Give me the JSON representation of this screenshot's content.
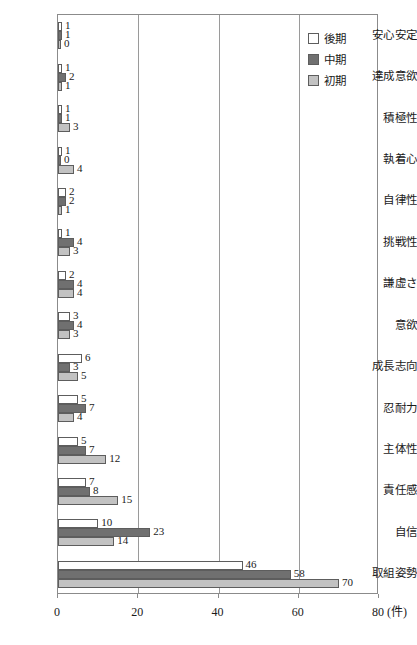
{
  "chart_data": {
    "type": "bar",
    "orientation": "horizontal",
    "title": "",
    "xlabel": "(件)",
    "ylabel": "",
    "xlim": [
      0,
      80
    ],
    "xticks": [
      0,
      20,
      40,
      60,
      80
    ],
    "xtick_labels": [
      "0",
      "20",
      "40",
      "60",
      "80"
    ],
    "grid": true,
    "grid_axis": "x",
    "legend_position": "top-right",
    "categories": [
      "安心安定",
      "達成意欲",
      "積極性",
      "執着心",
      "自律性",
      "挑戦性",
      "謙虚さ",
      "意欲",
      "成長志向",
      "忍耐力",
      "主体性",
      "責任感",
      "自信",
      "取組姿勢"
    ],
    "series": [
      {
        "name": "後期",
        "color": "#ffffff",
        "values": [
          1,
          1,
          1,
          1,
          2,
          1,
          2,
          3,
          6,
          5,
          5,
          7,
          10,
          46
        ]
      },
      {
        "name": "中期",
        "color": "#707070",
        "values": [
          1,
          2,
          1,
          0,
          2,
          4,
          4,
          4,
          3,
          7,
          7,
          8,
          23,
          58
        ]
      },
      {
        "name": "初期",
        "color": "#c2c2c2",
        "values": [
          0,
          1,
          3,
          4,
          1,
          3,
          4,
          3,
          5,
          4,
          12,
          15,
          14,
          70
        ]
      }
    ]
  },
  "legend": {
    "entries": [
      {
        "label": "後期",
        "swatch": "white-swatch"
      },
      {
        "label": "中期",
        "swatch": "dark-gray-swatch"
      },
      {
        "label": "初期",
        "swatch": "light-gray-swatch"
      }
    ]
  },
  "axis": {
    "unit_label": "(件)"
  }
}
